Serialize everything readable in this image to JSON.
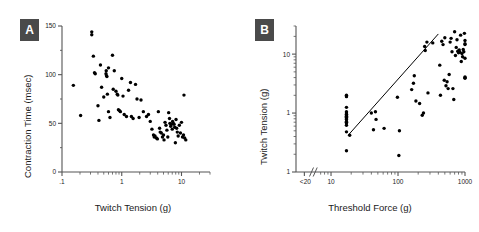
{
  "figure": {
    "background": "#ffffff",
    "marker_color": "#000000",
    "axis_color": "#555555",
    "badge_color": "#4a4a4a",
    "badge_text_color": "#ffffff"
  },
  "panels": [
    {
      "label": "A",
      "badge_label": "A"
    },
    {
      "label": "B",
      "badge_label": "B"
    }
  ],
  "chart_data": [
    {
      "type": "scatter",
      "panel": "A",
      "title": "",
      "xlabel": "Twitch Tension (g)",
      "ylabel": "Contraction Time (msec)",
      "xscale": "log",
      "yscale": "linear",
      "xlim": [
        0.1,
        30
      ],
      "ylim": [
        0,
        150
      ],
      "grid": false,
      "legend": "none",
      "xticks": [
        0.1,
        1,
        10
      ],
      "xticklabels": [
        ".1",
        "1",
        "10"
      ],
      "yticks": [
        0,
        50,
        100,
        150
      ],
      "yticklabels": [
        "0",
        "50",
        "100",
        "150"
      ],
      "yminorticks": [
        25,
        75,
        125
      ],
      "points": [
        [
          0.155,
          89
        ],
        [
          0.205,
          58
        ],
        [
          0.315,
          144
        ],
        [
          0.315,
          141
        ],
        [
          0.335,
          119
        ],
        [
          0.35,
          102
        ],
        [
          0.36,
          101
        ],
        [
          0.4,
          68
        ],
        [
          0.415,
          53
        ],
        [
          0.44,
          110
        ],
        [
          0.46,
          87
        ],
        [
          0.5,
          77
        ],
        [
          0.545,
          101
        ],
        [
          0.55,
          104
        ],
        [
          0.555,
          99
        ],
        [
          0.565,
          98
        ],
        [
          0.575,
          80
        ],
        [
          0.6,
          107
        ],
        [
          0.6,
          62
        ],
        [
          0.635,
          56
        ],
        [
          0.7,
          120
        ],
        [
          0.72,
          85
        ],
        [
          0.75,
          104
        ],
        [
          0.8,
          83
        ],
        [
          0.84,
          80
        ],
        [
          0.86,
          79
        ],
        [
          0.88,
          64
        ],
        [
          0.92,
          63
        ],
        [
          0.95,
          62
        ],
        [
          1.0,
          96
        ],
        [
          1.05,
          78
        ],
        [
          1.1,
          59
        ],
        [
          1.2,
          57
        ],
        [
          1.3,
          84
        ],
        [
          1.4,
          92
        ],
        [
          1.45,
          57
        ],
        [
          1.55,
          55
        ],
        [
          1.7,
          90
        ],
        [
          1.8,
          75
        ],
        [
          1.95,
          56
        ],
        [
          2.1,
          74
        ],
        [
          2.3,
          62
        ],
        [
          2.6,
          57
        ],
        [
          2.8,
          59
        ],
        [
          3.0,
          52
        ],
        [
          3.2,
          44
        ],
        [
          3.4,
          38
        ],
        [
          3.5,
          36
        ],
        [
          3.6,
          37
        ],
        [
          3.8,
          35
        ],
        [
          3.95,
          34
        ],
        [
          4.1,
          62
        ],
        [
          4.3,
          45
        ],
        [
          4.4,
          41
        ],
        [
          4.6,
          40
        ],
        [
          4.8,
          36
        ],
        [
          5.0,
          38
        ],
        [
          5.1,
          33
        ],
        [
          5.3,
          51
        ],
        [
          5.5,
          48
        ],
        [
          5.7,
          43
        ],
        [
          5.9,
          36
        ],
        [
          6.1,
          61
        ],
        [
          6.3,
          55
        ],
        [
          6.4,
          50
        ],
        [
          6.6,
          47
        ],
        [
          6.8,
          49
        ],
        [
          7.0,
          44
        ],
        [
          7.1,
          52
        ],
        [
          7.3,
          50
        ],
        [
          7.5,
          49
        ],
        [
          7.7,
          46
        ],
        [
          7.9,
          30
        ],
        [
          8.1,
          54
        ],
        [
          8.3,
          45
        ],
        [
          8.5,
          41
        ],
        [
          8.8,
          37
        ],
        [
          9.2,
          48
        ],
        [
          9.6,
          40
        ],
        [
          10.0,
          51
        ],
        [
          10.4,
          36
        ],
        [
          10.8,
          38
        ],
        [
          11.3,
          35
        ],
        [
          11.8,
          33
        ],
        [
          11.0,
          79
        ]
      ]
    },
    {
      "type": "scatter",
      "panel": "B",
      "title": "",
      "xlabel": "Threshold Force (g)",
      "ylabel": "Twitch Tension (g)",
      "xscale": "log",
      "yscale": "log",
      "xlim": [
        3,
        1000
      ],
      "ylim": [
        0.1,
        30
      ],
      "grid": false,
      "legend": "none",
      "axis_break": true,
      "xticks": [
        4,
        10,
        100,
        1000
      ],
      "xticklabels": [
        "<20",
        "10",
        "100",
        "1000"
      ],
      "yticks": [
        0.1,
        1,
        10
      ],
      "yticklabels": [
        "1",
        "1",
        "10"
      ],
      "regression_line": {
        "x1": 18,
        "y1": 0.42,
        "x2": 400,
        "y2": 22
      },
      "points": [
        [
          17,
          2.0
        ],
        [
          17,
          1.9
        ],
        [
          17,
          1.25
        ],
        [
          17,
          1.0
        ],
        [
          17,
          0.95
        ],
        [
          17,
          0.9
        ],
        [
          17,
          0.85
        ],
        [
          17,
          0.8
        ],
        [
          17,
          0.78
        ],
        [
          17,
          0.72
        ],
        [
          17,
          0.7
        ],
        [
          17,
          0.68
        ],
        [
          17,
          0.62
        ],
        [
          17,
          0.48
        ],
        [
          17,
          0.23
        ],
        [
          17,
          1.05
        ],
        [
          17,
          0.88
        ],
        [
          19,
          0.42
        ],
        [
          43,
          0.52
        ],
        [
          46,
          1.05
        ],
        [
          47,
          0.78
        ],
        [
          40,
          1.0
        ],
        [
          62,
          0.55
        ],
        [
          105,
          0.5
        ],
        [
          98,
          1.85
        ],
        [
          103,
          0.19
        ],
        [
          160,
          2.5
        ],
        [
          170,
          3.2
        ],
        [
          175,
          4.3
        ],
        [
          185,
          1.6
        ],
        [
          210,
          1.45
        ],
        [
          230,
          0.92
        ],
        [
          240,
          1.0
        ],
        [
          250,
          13.5
        ],
        [
          255,
          11.5
        ],
        [
          270,
          16.0
        ],
        [
          280,
          2.2
        ],
        [
          330,
          15.5
        ],
        [
          420,
          6.5
        ],
        [
          430,
          2.0
        ],
        [
          450,
          16.5
        ],
        [
          470,
          14.5
        ],
        [
          490,
          3.6
        ],
        [
          500,
          19.0
        ],
        [
          520,
          2.9
        ],
        [
          540,
          3.4
        ],
        [
          560,
          2.6
        ],
        [
          580,
          4.5
        ],
        [
          600,
          16.0
        ],
        [
          620,
          18.5
        ],
        [
          640,
          11.0
        ],
        [
          660,
          2.6
        ],
        [
          680,
          1.7
        ],
        [
          700,
          24.0
        ],
        [
          720,
          9.5
        ],
        [
          740,
          13.0
        ],
        [
          760,
          17.5
        ],
        [
          780,
          11.2
        ],
        [
          800,
          10.5
        ],
        [
          820,
          11.8
        ],
        [
          840,
          10.8
        ],
        [
          860,
          21.0
        ],
        [
          880,
          7.5
        ],
        [
          900,
          10.2
        ],
        [
          920,
          9.0
        ],
        [
          940,
          12.0
        ],
        [
          960,
          11.0
        ],
        [
          980,
          22.5
        ],
        [
          1000,
          8.5
        ],
        [
          1050,
          4.1
        ],
        [
          1100,
          4.0
        ],
        [
          1150,
          3.9
        ],
        [
          1200,
          17.0
        ],
        [
          1300,
          14.5
        ],
        [
          1500,
          15.0
        ]
      ]
    }
  ]
}
